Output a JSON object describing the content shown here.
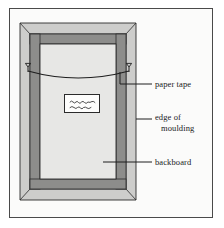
{
  "figure": {
    "background_color": "#fbfbfa",
    "border_color": "#4a4a4a"
  },
  "callouts": [
    {
      "id": "paper-tape",
      "label": "paper tape",
      "line2": "",
      "target": "paper tape strung across back of frame"
    },
    {
      "id": "edge-of-moulding",
      "label": "edge of",
      "line2": "moulding",
      "target": "outer bevelled edge of frame moulding"
    },
    {
      "id": "backboard",
      "label": "backboard",
      "line2": "",
      "target": "backing board set inside the rebate"
    }
  ],
  "parts": {
    "moulding": {
      "name": "moulding",
      "face_color": "#c9c9c7",
      "inner_band_color": "#8f8f8d",
      "outline_color": "#2b2b2b"
    },
    "backboard": {
      "name": "backboard",
      "fill_color": "#e6e6e4",
      "outline_color": "#2b2b2b"
    },
    "paper_tape": {
      "name": "paper tape",
      "stroke_color": "#1e1e1e",
      "sag": "shallow downward curve"
    },
    "fixings": {
      "name": "d-ring fixings",
      "count": 2,
      "stroke_color": "#1e1e1e"
    },
    "label": {
      "name": "handwritten label",
      "text": "",
      "description": "small white label with illegible handwriting",
      "fill_color": "#fdfdfc",
      "outline_color": "#2b2b2b"
    }
  }
}
